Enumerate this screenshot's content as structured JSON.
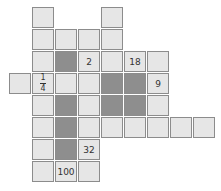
{
  "puzzle": {
    "origin": {
      "x": 9,
      "y": 7
    },
    "cell_w": 23,
    "cell_h": 22,
    "colors": {
      "light": "#e6e6e6",
      "dark": "#8e8e8e",
      "border": "#8c8c8c",
      "text": "#333333"
    },
    "cells": [
      {
        "r": 0,
        "c": 1
      },
      {
        "r": 0,
        "c": 4
      },
      {
        "r": 1,
        "c": 1
      },
      {
        "r": 1,
        "c": 2
      },
      {
        "r": 1,
        "c": 3
      },
      {
        "r": 1,
        "c": 4
      },
      {
        "r": 2,
        "c": 1
      },
      {
        "r": 2,
        "c": 2,
        "dark": true
      },
      {
        "r": 2,
        "c": 3,
        "text": "2"
      },
      {
        "r": 2,
        "c": 4
      },
      {
        "r": 2,
        "c": 5,
        "text": "18"
      },
      {
        "r": 2,
        "c": 6
      },
      {
        "r": 3,
        "c": 0
      },
      {
        "r": 3,
        "c": 1,
        "frac": [
          "1",
          "4"
        ]
      },
      {
        "r": 3,
        "c": 2
      },
      {
        "r": 3,
        "c": 3
      },
      {
        "r": 3,
        "c": 4,
        "dark": true
      },
      {
        "r": 3,
        "c": 5,
        "dark": true
      },
      {
        "r": 3,
        "c": 6,
        "text": "9"
      },
      {
        "r": 4,
        "c": 1
      },
      {
        "r": 4,
        "c": 2,
        "dark": true
      },
      {
        "r": 4,
        "c": 3
      },
      {
        "r": 4,
        "c": 4,
        "dark": true
      },
      {
        "r": 4,
        "c": 5,
        "dark": true
      },
      {
        "r": 4,
        "c": 6
      },
      {
        "r": 5,
        "c": 1
      },
      {
        "r": 5,
        "c": 2,
        "dark": true
      },
      {
        "r": 5,
        "c": 3
      },
      {
        "r": 5,
        "c": 4
      },
      {
        "r": 5,
        "c": 5
      },
      {
        "r": 5,
        "c": 6
      },
      {
        "r": 5,
        "c": 7
      },
      {
        "r": 5,
        "c": 8
      },
      {
        "r": 6,
        "c": 1
      },
      {
        "r": 6,
        "c": 2,
        "dark": true
      },
      {
        "r": 6,
        "c": 3,
        "text": "32"
      },
      {
        "r": 7,
        "c": 1
      },
      {
        "r": 7,
        "c": 2,
        "text": "100"
      },
      {
        "r": 7,
        "c": 3
      }
    ]
  }
}
